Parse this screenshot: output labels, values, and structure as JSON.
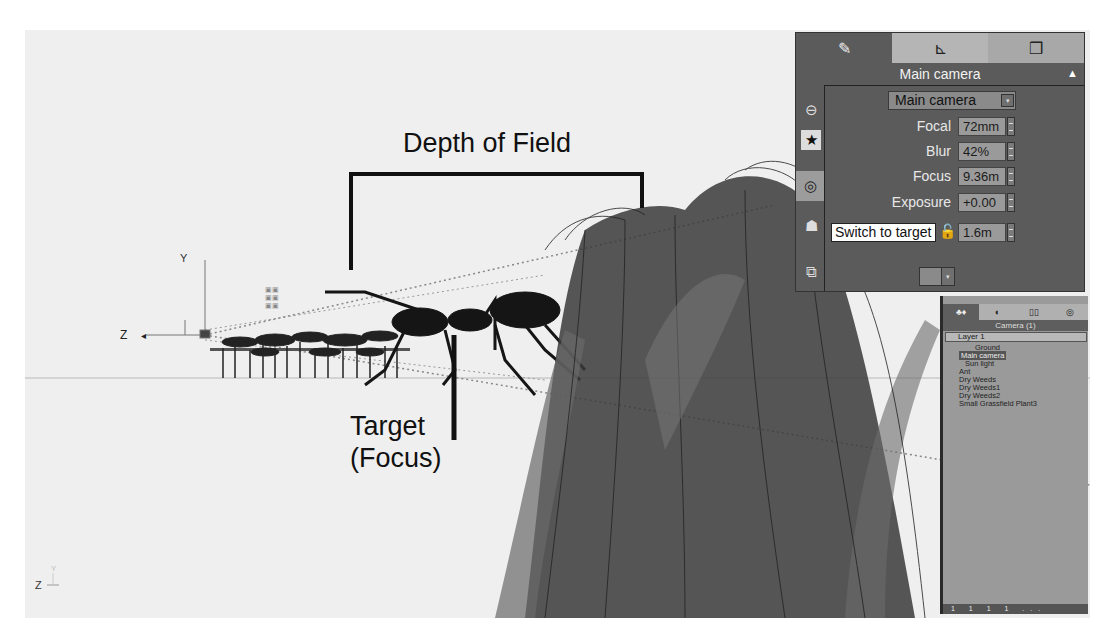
{
  "viewport": {
    "annotations": {
      "depth_of_field": "Depth of Field",
      "target_line1": "Target",
      "target_line2": "(Focus)"
    },
    "axis_gizmo": {
      "z_label": "Z",
      "y_label": "Y"
    },
    "corner_axis": {
      "z_label": "Z",
      "y_label": "Y"
    }
  },
  "camera_panel": {
    "tabs": [
      {
        "icon": "paint-brush-icon",
        "glyph": "✎"
      },
      {
        "icon": "ruler-icon",
        "glyph": "⊾"
      },
      {
        "icon": "cubes-icon",
        "glyph": "❒"
      }
    ],
    "title": "Main camera",
    "collapse_glyph": "▲",
    "camera_select": {
      "value": "Main camera",
      "dropdown_glyph": "▾"
    },
    "side_icons": [
      {
        "name": "view-icon",
        "glyph": "⊖"
      },
      {
        "name": "star-easel-icon",
        "glyph": "★"
      },
      {
        "name": "target-icon",
        "glyph": "◎"
      },
      {
        "name": "camera-person-icon",
        "glyph": "☗"
      },
      {
        "name": "render-icon",
        "glyph": "⧉"
      }
    ],
    "properties": [
      {
        "label": "Focal",
        "value": "72mm"
      },
      {
        "label": "Blur",
        "value": "42%"
      },
      {
        "label": "Focus",
        "value": "9.36m"
      },
      {
        "label": "Exposure",
        "value": "+0.00"
      },
      {
        "label": "",
        "value": "1.6m"
      }
    ],
    "tooltip": "Switch to target",
    "lock_glyph": "🔓",
    "swatch_dropdown_glyph": "▾"
  },
  "explorer": {
    "tabs": [
      {
        "label": "♣♦",
        "active": true
      },
      {
        "label": "◐",
        "active": false
      },
      {
        "label": "▯▯",
        "active": false
      },
      {
        "label": "◎",
        "active": false
      }
    ],
    "header": "Camera (1)",
    "layer": "Layer 1",
    "items": [
      {
        "label": "Ground",
        "selected": false
      },
      {
        "label": "Main camera",
        "selected": true
      },
      {
        "label": "Sun light",
        "selected": false
      },
      {
        "label": "Ant",
        "selected": false
      },
      {
        "label": "Dry Weeds",
        "selected": false
      },
      {
        "label": "Dry Weeds1",
        "selected": false
      },
      {
        "label": "Dry Weeds2",
        "selected": false
      },
      {
        "label": "Small Grassfield Plant3",
        "selected": false
      }
    ],
    "footer": "1 1 1 1 ..."
  }
}
